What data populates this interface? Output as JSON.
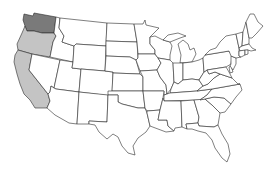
{
  "map": {
    "title": "United States map",
    "colors": {
      "default_fill": "#ffffff",
      "stroke": "#2a2a2a",
      "dark_highlight": "#7a7a7a",
      "light_highlight": "#c4c4c4"
    },
    "highlighted_states": [
      {
        "state": "Washington",
        "shade": "dark",
        "fill": "#7a7a7a"
      },
      {
        "state": "Oregon",
        "shade": "light",
        "fill": "#c4c4c4"
      },
      {
        "state": "California",
        "shade": "light",
        "fill": "#c4c4c4"
      }
    ]
  }
}
